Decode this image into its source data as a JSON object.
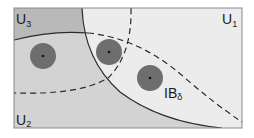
{
  "diagram": {
    "type": "set-cover-illustration",
    "regions": [
      {
        "id": "U1",
        "label": "U",
        "subscript": "1",
        "fill": "#ececec"
      },
      {
        "id": "U2",
        "label": "U",
        "subscript": "2",
        "fill": "#d3d3d3"
      },
      {
        "id": "U3",
        "label": "U",
        "subscript": "3",
        "fill": "#b9b9b9"
      }
    ],
    "balls": [
      {
        "cx": 43,
        "cy": 56,
        "r": 13
      },
      {
        "cx": 109,
        "cy": 52,
        "r": 13
      },
      {
        "cx": 150,
        "cy": 78,
        "r": 13
      }
    ],
    "ball_label": {
      "main": "IB",
      "subscript": "δ"
    },
    "colors": {
      "frame": "#8a8a8a",
      "ball_fill": "#6e6e6e",
      "center_dot": "#111111",
      "curve": "#2a2a2a",
      "background": "#ececec"
    }
  }
}
